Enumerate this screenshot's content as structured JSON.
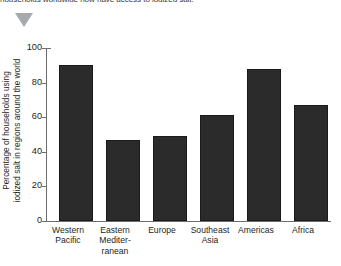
{
  "caption": {
    "text": "households worldwide now have access to iodized salt."
  },
  "marker": {
    "name": "triangle-marker",
    "color": "#a7a9ac"
  },
  "chart_data": {
    "type": "bar",
    "title": "",
    "subtitle": "",
    "xlabel": "",
    "ylabel_lines": [
      "Percentage of households using",
      "iodized salt in regions around the world"
    ],
    "ylabel": "Percentage of households using iodized salt in regions around the world",
    "categories": [
      "Western Pacific",
      "Eastern Mediterranean",
      "Europe",
      "Southeast Asia",
      "Americas",
      "Africa"
    ],
    "category_lines": [
      [
        "Western",
        "Pacific"
      ],
      [
        "Eastern",
        "Mediter-",
        "ranean"
      ],
      [
        "Europe"
      ],
      [
        "Southeast",
        "Asia"
      ],
      [
        "Americas"
      ],
      [
        "Africa"
      ]
    ],
    "values": [
      90,
      47,
      49,
      61,
      88,
      67
    ],
    "ylim": [
      0,
      100
    ],
    "yticks": [
      0,
      20,
      40,
      60,
      80,
      100
    ],
    "ytick_labels": [
      "0",
      "20",
      "40",
      "60",
      "80",
      "100"
    ],
    "grid": false,
    "legend": false,
    "bar_color": "#2b2b2b",
    "axis_color": "#6d6e71"
  }
}
